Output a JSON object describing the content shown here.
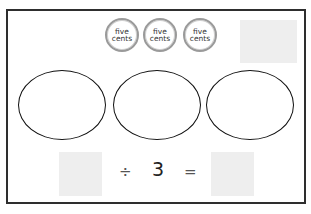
{
  "coins": [
    {
      "line1": "five",
      "line2": "cents"
    },
    {
      "line1": "five",
      "line2": "cents"
    },
    {
      "line1": "five",
      "line2": "cents"
    }
  ],
  "equation": {
    "divide_sign": "÷",
    "divisor": "3",
    "equals_sign": "="
  },
  "groups_count": 3,
  "colors": {
    "drop_box": "#eeeeee",
    "border": "#2e2e2e",
    "coin_ring": "#9a9a9a"
  }
}
